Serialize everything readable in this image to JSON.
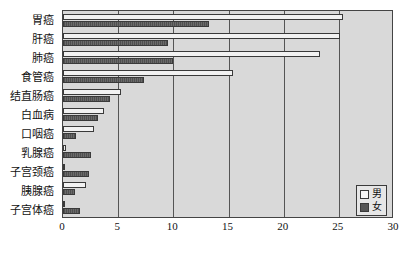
{
  "chart_data": {
    "type": "bar",
    "orientation": "horizontal",
    "title": "",
    "subtitle": "",
    "xlabel": "",
    "ylabel": "",
    "xlim": [
      0,
      30
    ],
    "xticks": [
      0,
      5,
      10,
      15,
      20,
      25,
      30
    ],
    "xtick_labels": [
      "0",
      "5",
      "10",
      "15",
      "20",
      "25",
      "30"
    ],
    "grid": true,
    "grid_axis": "x",
    "legend_position": "lower-right",
    "categories": [
      "胃癌",
      "肝癌",
      "肺癌",
      "食管癌",
      "结直肠癌",
      "白血病",
      "口咽癌",
      "乳腺癌",
      "子宫颈癌",
      "胰腺癌",
      "子宫体癌"
    ],
    "series": [
      {
        "name": "男",
        "color": "#f2f2f2",
        "values": [
          25.4,
          25.1,
          23.3,
          15.4,
          5.3,
          3.7,
          2.8,
          0.3,
          0.2,
          2.1,
          0.0
        ]
      },
      {
        "name": "女",
        "color": "#5a5a5a",
        "values": [
          13.2,
          9.5,
          10.0,
          7.3,
          4.3,
          3.2,
          1.2,
          2.5,
          2.4,
          1.1,
          1.5
        ]
      }
    ]
  },
  "legend": {
    "items": [
      {
        "label": "男",
        "swatch": "male"
      },
      {
        "label": "女",
        "swatch": "female"
      }
    ]
  },
  "colors": {
    "plot_background": "#d9d9d9",
    "axis": "#444444",
    "gridline": "#555555",
    "male_bar": "#f2f2f2",
    "female_bar": "#5a5a5a",
    "legend_background": "#e6e6e6",
    "text": "#111111"
  }
}
